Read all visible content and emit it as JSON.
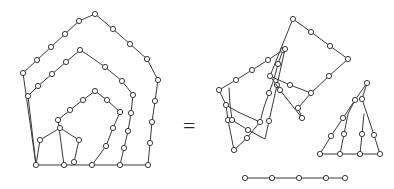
{
  "figure": {
    "type": "geometric-graph-diagram",
    "background_color": "#ffffff",
    "edge_color": "#3a3a3a",
    "node_fill_color": "#ffffff",
    "node_stroke_color": "#3a3a3a",
    "node_radius": 2.6,
    "edge_width": 1,
    "relation_symbol": "=",
    "relation_symbol_position": {
      "x": 183,
      "y": 133
    },
    "left_side": {
      "label": "nested-spiral-pentagon",
      "paths": [
        {
          "name": "outer-ring",
          "closed": false,
          "points": [
            [
              23,
              73
            ],
            [
              37,
              60
            ],
            [
              51,
              47
            ],
            [
              65,
              34
            ],
            [
              79,
              21
            ],
            [
              95,
              14
            ],
            [
              113,
              29
            ],
            [
              130,
              44
            ],
            [
              147,
              59
            ],
            [
              158,
              80
            ],
            [
              155,
              101
            ],
            [
              152,
              122
            ],
            [
              150,
              143
            ],
            [
              148,
              165
            ],
            [
              120,
              165
            ],
            [
              92,
              165
            ],
            [
              64,
              165
            ],
            [
              36,
              165
            ],
            [
              23,
              73
            ]
          ]
        },
        {
          "name": "second-ring",
          "closed": false,
          "points": [
            [
              36,
              165
            ],
            [
              28,
              96
            ],
            [
              38,
              86
            ],
            [
              52,
              74
            ],
            [
              66,
              62
            ],
            [
              80,
              50
            ],
            [
              85,
              53
            ],
            [
              105,
              67
            ],
            [
              122,
              81
            ],
            [
              133,
              95
            ],
            [
              131,
              113
            ],
            [
              128,
              131
            ],
            [
              124,
              148
            ],
            [
              120,
              165
            ]
          ]
        },
        {
          "name": "third-ring",
          "closed": false,
          "points": [
            [
              64,
              165
            ],
            [
              58,
              120
            ],
            [
              70,
              110
            ],
            [
              83,
              100
            ],
            [
              95,
              91
            ],
            [
              107,
              100
            ],
            [
              120,
              112
            ],
            [
              113,
              128
            ],
            [
              106,
              146
            ],
            [
              92,
              165
            ]
          ]
        },
        {
          "name": "inner-pentagon",
          "closed": false,
          "points": [
            [
              36,
              165
            ],
            [
              40,
              140
            ],
            [
              60,
              128
            ],
            [
              79,
              140
            ],
            [
              74,
              162
            ]
          ]
        }
      ],
      "nodes": [
        [
          23,
          73
        ],
        [
          37,
          60
        ],
        [
          51,
          47
        ],
        [
          65,
          34
        ],
        [
          79,
          21
        ],
        [
          95,
          14
        ],
        [
          113,
          29
        ],
        [
          130,
          44
        ],
        [
          147,
          59
        ],
        [
          158,
          80
        ],
        [
          155,
          101
        ],
        [
          152,
          122
        ],
        [
          150,
          143
        ],
        [
          148,
          165
        ],
        [
          120,
          165
        ],
        [
          92,
          165
        ],
        [
          64,
          165
        ],
        [
          36,
          165
        ],
        [
          28,
          96
        ],
        [
          38,
          86
        ],
        [
          52,
          74
        ],
        [
          66,
          62
        ],
        [
          80,
          50
        ],
        [
          105,
          67
        ],
        [
          122,
          81
        ],
        [
          133,
          95
        ],
        [
          131,
          113
        ],
        [
          128,
          131
        ],
        [
          124,
          148
        ],
        [
          58,
          120
        ],
        [
          70,
          110
        ],
        [
          83,
          100
        ],
        [
          95,
          91
        ],
        [
          107,
          100
        ],
        [
          120,
          112
        ],
        [
          113,
          128
        ],
        [
          106,
          146
        ],
        [
          40,
          140
        ],
        [
          60,
          128
        ],
        [
          79,
          140
        ],
        [
          74,
          162
        ]
      ]
    },
    "right_side": {
      "label": "dissected-pieces",
      "pieces": [
        {
          "name": "piece-upper-left-strip",
          "paths": [
            {
              "points": [
                [
                  219,
                  90
                ],
                [
                  236,
                  80
                ],
                [
                  252,
                  70
                ],
                [
                  268,
                  60
                ],
                [
                  283,
                  50
                ],
                [
                  278,
                  64
                ],
                [
                  274,
                  79
                ],
                [
                  269,
                  93
                ],
                [
                  264,
                  107
                ],
                [
                  260,
                  122
                ],
                [
                  238,
                  112
                ],
                [
                  226,
                  105
                ],
                [
                  219,
                  90
                ]
              ]
            },
            {
              "points": [
                [
                  226,
                  105
                ],
                [
                  228,
                  120
                ],
                [
                  231,
                  135
                ],
                [
                  234,
                  150
                ]
              ]
            },
            {
              "points": [
                [
                  260,
                  122
                ],
                [
                  247,
                  138
                ],
                [
                  234,
                  150
                ]
              ]
            }
          ],
          "nodes": [
            [
              219,
              90
            ],
            [
              236,
              80
            ],
            [
              252,
              70
            ],
            [
              268,
              60
            ],
            [
              283,
              50
            ],
            [
              278,
              64
            ],
            [
              269,
              93
            ],
            [
              260,
              122
            ],
            [
              226,
              105
            ],
            [
              228,
              120
            ],
            [
              234,
              150
            ],
            [
              247,
              138
            ]
          ]
        },
        {
          "name": "piece-center-sliver",
          "paths": [
            {
              "points": [
                [
                  285,
                  49
                ],
                [
                  281,
                  67
                ],
                [
                  277,
                  85
                ],
                [
                  273,
                  103
                ],
                [
                  269,
                  121
                ],
                [
                  265,
                  139
                ],
                [
                  248,
                  130
                ],
                [
                  232,
                  120
                ],
                [
                  230,
                  104
                ],
                [
                  229,
                  88
                ]
              ]
            }
          ],
          "nodes": [
            [
              285,
              49
            ],
            [
              277,
              85
            ],
            [
              269,
              121
            ],
            [
              248,
              130
            ],
            [
              232,
              120
            ]
          ]
        },
        {
          "name": "piece-large-quad",
          "paths": [
            {
              "points": [
                [
                  293,
                  19
                ],
                [
                  311,
                  32
                ],
                [
                  330,
                  46
                ],
                [
                  348,
                  59
                ],
                [
                  329,
                  76
                ],
                [
                  311,
                  93
                ],
                [
                  290,
                  85
                ],
                [
                  270,
                  76
                ],
                [
                  280,
                  51
                ],
                [
                  290,
                  26
                ],
                [
                  293,
                  19
                ]
              ]
            },
            {
              "points": [
                [
                  270,
                  76
                ],
                [
                  280,
                  90
                ],
                [
                  291,
                  104
                ],
                [
                  302,
                  118
                ]
              ]
            },
            {
              "points": [
                [
                  311,
                  93
                ],
                [
                  298,
                  108
                ],
                [
                  302,
                  118
                ]
              ]
            }
          ],
          "nodes": [
            [
              293,
              19
            ],
            [
              311,
              32
            ],
            [
              330,
              46
            ],
            [
              348,
              59
            ],
            [
              329,
              76
            ],
            [
              311,
              93
            ],
            [
              290,
              85
            ],
            [
              270,
              76
            ],
            [
              280,
              90
            ],
            [
              302,
              118
            ],
            [
              298,
              108
            ]
          ]
        },
        {
          "name": "piece-lower-right-fan",
          "paths": [
            {
              "points": [
                [
                  367,
                  83
                ],
                [
                  355,
                  100
                ],
                [
                  343,
                  118
                ],
                [
                  331,
                  136
                ],
                [
                  320,
                  154
                ]
              ]
            },
            {
              "points": [
                [
                  320,
                  154
                ],
                [
                  340,
                  154
                ],
                [
                  360,
                  154
                ],
                [
                  380,
                  154
                ]
              ]
            },
            {
              "points": [
                [
                  380,
                  154
                ],
                [
                  374,
                  135
                ],
                [
                  368,
                  117
                ],
                [
                  362,
                  99
                ],
                [
                  367,
                  83
                ]
              ]
            },
            {
              "points": [
                [
                  340,
                  154
                ],
                [
                  344,
                  134
                ],
                [
                  348,
                  114
                ],
                [
                  355,
                  100
                ]
              ]
            },
            {
              "points": [
                [
                  360,
                  154
                ],
                [
                  362,
                  134
                ],
                [
                  364,
                  114
                ]
              ]
            }
          ],
          "nodes": [
            [
              367,
              83
            ],
            [
              355,
              100
            ],
            [
              343,
              118
            ],
            [
              331,
              136
            ],
            [
              320,
              154
            ],
            [
              340,
              154
            ],
            [
              360,
              154
            ],
            [
              380,
              154
            ],
            [
              374,
              135
            ],
            [
              362,
              99
            ],
            [
              344,
              134
            ],
            [
              362,
              134
            ]
          ]
        },
        {
          "name": "piece-bottom-segment",
          "paths": [
            {
              "points": [
                [
                  245,
                  178
                ],
                [
                  272,
                  178
                ],
                [
                  299,
                  178
                ],
                [
                  326,
                  178
                ],
                [
                  345,
                  178
                ]
              ]
            }
          ],
          "nodes": [
            [
              245,
              178
            ],
            [
              272,
              178
            ],
            [
              299,
              178
            ],
            [
              326,
              178
            ],
            [
              345,
              178
            ]
          ]
        }
      ]
    }
  }
}
